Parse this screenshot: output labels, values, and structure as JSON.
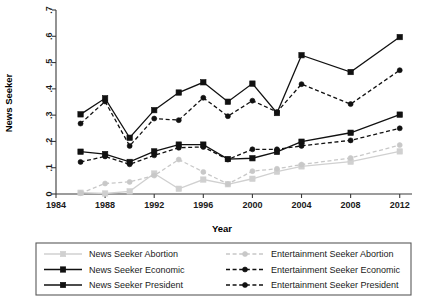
{
  "chart_data": {
    "type": "line",
    "title": "",
    "xlabel": "Year",
    "ylabel": "News Seeker",
    "xlim": [
      1984,
      2013
    ],
    "ylim": [
      0,
      0.7
    ],
    "xticks": [
      1984,
      1988,
      1992,
      1996,
      2000,
      2004,
      2008,
      2012
    ],
    "xticklabels": [
      "1984",
      "1988",
      "1992",
      "1996",
      "2000",
      "2004",
      "2008",
      "2012"
    ],
    "yticks": [
      0,
      0.1,
      0.2,
      0.3,
      0.4,
      0.5,
      0.6,
      0.7
    ],
    "yticklabels": [
      "0",
      ".1",
      ".2",
      ".3",
      ".4",
      ".5",
      ".6",
      ".7"
    ],
    "grid": false,
    "legend_position": "below",
    "x": [
      1986,
      1988,
      1990,
      1992,
      1994,
      1996,
      1998,
      2000,
      2002,
      2004,
      2008,
      2012
    ],
    "series": [
      {
        "name": "News Seeker Abortion",
        "color": "#d0d0d0",
        "dash": "solid",
        "marker": "square",
        "values": [
          0.005,
          0.002,
          0.01,
          0.078,
          0.02,
          0.055,
          0.037,
          0.058,
          0.085,
          0.105,
          0.123,
          0.162
        ]
      },
      {
        "name": "News Seeker Economic",
        "color": "#111111",
        "dash": "solid",
        "marker": "square",
        "values": [
          0.161,
          0.152,
          0.122,
          0.162,
          0.188,
          0.188,
          0.133,
          0.136,
          0.16,
          0.199,
          0.233,
          0.302
        ]
      },
      {
        "name": "News Seeker President",
        "color": "#111111",
        "dash": "solid",
        "marker": "square",
        "values": [
          0.303,
          0.364,
          0.214,
          0.319,
          0.386,
          0.425,
          0.351,
          0.42,
          0.308,
          0.528,
          0.464,
          0.597
        ]
      },
      {
        "name": "Entertainment Seeker Abortion",
        "color": "#c8c8c8",
        "dash": "dashed",
        "marker": "circle",
        "values": [
          0.003,
          0.04,
          0.046,
          0.07,
          0.131,
          0.084,
          0.038,
          0.087,
          0.096,
          0.112,
          0.137,
          0.186
        ]
      },
      {
        "name": "Entertainment Seeker Economic",
        "color": "#111111",
        "dash": "dashed",
        "marker": "circle",
        "values": [
          0.122,
          0.143,
          0.113,
          0.147,
          0.176,
          0.179,
          0.131,
          0.17,
          0.17,
          0.183,
          0.204,
          0.25
        ]
      },
      {
        "name": "Entertainment Seeker President",
        "color": "#111111",
        "dash": "dashed",
        "marker": "circle",
        "values": [
          0.268,
          0.352,
          0.183,
          0.287,
          0.281,
          0.366,
          0.296,
          0.355,
          0.312,
          0.418,
          0.342,
          0.471
        ]
      }
    ]
  },
  "legend": {
    "entries": [
      {
        "label": "News Seeker Abortion",
        "color": "#d0d0d0",
        "dash": "solid",
        "marker": "square",
        "col": 0,
        "row": 0
      },
      {
        "label": "News Seeker Economic",
        "color": "#111111",
        "dash": "solid",
        "marker": "square",
        "col": 0,
        "row": 1
      },
      {
        "label": "News Seeker President",
        "color": "#111111",
        "dash": "solid",
        "marker": "square",
        "col": 0,
        "row": 2
      },
      {
        "label": "Entertainment Seeker Abortion",
        "color": "#c8c8c8",
        "dash": "dashed",
        "marker": "circle",
        "col": 1,
        "row": 0
      },
      {
        "label": "Entertainment Seeker Economic",
        "color": "#111111",
        "dash": "dashed",
        "marker": "circle",
        "col": 1,
        "row": 1
      },
      {
        "label": "Entertainment Seeker President",
        "color": "#111111",
        "dash": "dashed",
        "marker": "circle",
        "col": 1,
        "row": 2
      }
    ]
  }
}
